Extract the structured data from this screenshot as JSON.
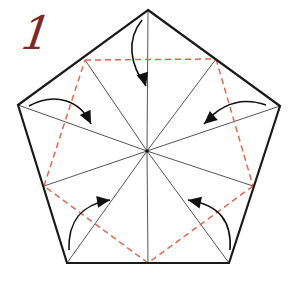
{
  "diagram": {
    "step_number": "1",
    "colors": {
      "outline": "#1a1a1a",
      "crease": "#555555",
      "valley_fold": "#e06a50",
      "arrow": "#111111",
      "step_number": "#7a2a2a"
    },
    "pentagon": {
      "vertices": [
        [
          148,
          10
        ],
        [
          280,
          106
        ],
        [
          229,
          263
        ],
        [
          67,
          263
        ],
        [
          18,
          105
        ]
      ]
    },
    "center": [
      147,
      151
    ],
    "edge_midpoints": [
      [
        85,
        60
      ],
      [
        216,
        59
      ],
      [
        253,
        186
      ],
      [
        148,
        263
      ],
      [
        44,
        186
      ]
    ],
    "valley_fold_lines": [
      [
        [
          85,
          60
        ],
        [
          216,
          59
        ]
      ],
      [
        [
          216,
          59
        ],
        [
          253,
          186
        ]
      ],
      [
        [
          253,
          186
        ],
        [
          148,
          263
        ]
      ],
      [
        [
          148,
          263
        ],
        [
          44,
          186
        ]
      ],
      [
        [
          44,
          186
        ],
        [
          85,
          60
        ]
      ]
    ],
    "arrows": [
      {
        "name": "arrow-top",
        "path": "M142,20 C126,40 130,65 146,86",
        "tip": [
          146,
          86
        ],
        "dir": [
          0.3,
          1
        ]
      },
      {
        "name": "arrow-left",
        "path": "M29,106 C55,92 80,100 91,124",
        "tip": [
          91,
          124
        ],
        "dir": [
          0.5,
          1
        ]
      },
      {
        "name": "arrow-right",
        "path": "M266,105 C240,96 220,105 204,124",
        "tip": [
          204,
          124
        ],
        "dir": [
          -0.8,
          0.7
        ]
      },
      {
        "name": "arrow-bottom-left",
        "path": "M69,250 C68,222 80,205 110,200",
        "tip": [
          110,
          200
        ],
        "dir": [
          1,
          -0.15
        ]
      },
      {
        "name": "arrow-bottom-right",
        "path": "M230,250 C232,222 220,205 188,200",
        "tip": [
          188,
          200
        ],
        "dir": [
          -1,
          -0.2
        ]
      }
    ]
  }
}
